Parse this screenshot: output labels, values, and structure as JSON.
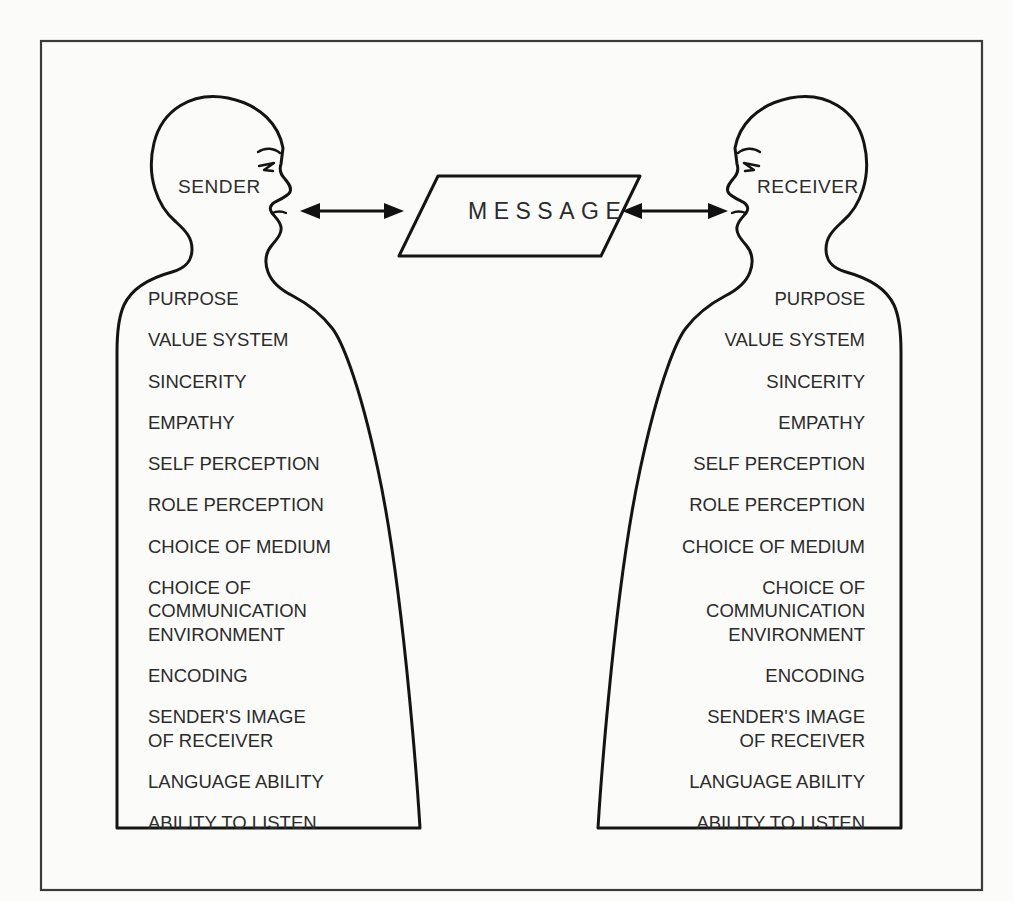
{
  "diagram": {
    "background_color": "#fbfbfa",
    "ink_color": "#141414",
    "frame_color": "#3a3a3a",
    "message": {
      "label": "MESSAGE",
      "shape": "parallelogram"
    },
    "arrows": {
      "left": {
        "name": "sender-to-message-arrow",
        "style": "double-headed"
      },
      "right": {
        "name": "message-to-receiver-arrow",
        "style": "double-headed"
      }
    },
    "sender": {
      "role_label": "SENDER",
      "attributes": [
        {
          "lines": [
            "PURPOSE"
          ]
        },
        {
          "lines": [
            "VALUE SYSTEM"
          ]
        },
        {
          "lines": [
            "SINCERITY"
          ]
        },
        {
          "lines": [
            "EMPATHY"
          ]
        },
        {
          "lines": [
            "SELF PERCEPTION"
          ]
        },
        {
          "lines": [
            "ROLE PERCEPTION"
          ]
        },
        {
          "lines": [
            "CHOICE OF MEDIUM"
          ]
        },
        {
          "lines": [
            "CHOICE OF",
            "COMMUNICATION",
            "ENVIRONMENT"
          ]
        },
        {
          "lines": [
            "ENCODING"
          ]
        },
        {
          "lines": [
            "SENDER'S IMAGE",
            "OF RECEIVER"
          ]
        },
        {
          "lines": [
            "LANGUAGE ABILITY"
          ]
        },
        {
          "lines": [
            "ABILITY TO LISTEN"
          ]
        }
      ]
    },
    "receiver": {
      "role_label": "RECEIVER",
      "attributes": [
        {
          "lines": [
            "PURPOSE"
          ]
        },
        {
          "lines": [
            "VALUE SYSTEM"
          ]
        },
        {
          "lines": [
            "SINCERITY"
          ]
        },
        {
          "lines": [
            "EMPATHY"
          ]
        },
        {
          "lines": [
            "SELF PERCEPTION"
          ]
        },
        {
          "lines": [
            "ROLE PERCEPTION"
          ]
        },
        {
          "lines": [
            "CHOICE OF MEDIUM"
          ]
        },
        {
          "lines": [
            "CHOICE OF",
            "COMMUNICATION",
            "ENVIRONMENT"
          ]
        },
        {
          "lines": [
            "ENCODING"
          ]
        },
        {
          "lines": [
            "SENDER'S IMAGE",
            "OF RECEIVER"
          ]
        },
        {
          "lines": [
            "LANGUAGE ABILITY"
          ]
        },
        {
          "lines": [
            "ABILITY TO LISTEN"
          ]
        }
      ]
    }
  }
}
